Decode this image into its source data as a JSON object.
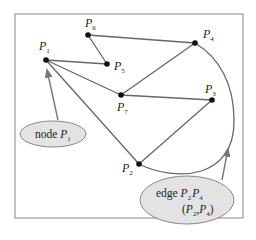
{
  "diagram": {
    "type": "graph",
    "nodes": [
      {
        "id": "P1",
        "label": "P",
        "sub": "1",
        "x": 46,
        "y": 60,
        "lx": 38,
        "ly": 50
      },
      {
        "id": "P2",
        "label": "P",
        "sub": "2",
        "x": 139,
        "y": 164,
        "lx": 122,
        "ly": 171
      },
      {
        "id": "P3",
        "label": "P",
        "sub": "3",
        "x": 212,
        "y": 100,
        "lx": 206,
        "ly": 92
      },
      {
        "id": "P4",
        "label": "P",
        "sub": "4",
        "x": 195,
        "y": 43,
        "lx": 203,
        "ly": 38
      },
      {
        "id": "P5",
        "label": "P",
        "sub": "5",
        "x": 107,
        "y": 64,
        "lx": 114,
        "ly": 70
      },
      {
        "id": "P6",
        "label": "P",
        "sub": "6",
        "x": 88,
        "y": 35,
        "lx": 85,
        "ly": 25
      },
      {
        "id": "P7",
        "label": "P",
        "sub": "7",
        "x": 121,
        "y": 95,
        "lx": 117,
        "ly": 111
      }
    ],
    "edges": [
      [
        "P1",
        "P5"
      ],
      [
        "P5",
        "P6"
      ],
      [
        "P6",
        "P4"
      ],
      [
        "P4",
        "P7"
      ],
      [
        "P7",
        "P3"
      ],
      [
        "P3",
        "P2"
      ],
      [
        "P1",
        "P7"
      ],
      [
        "P1",
        "P2"
      ],
      [
        "P2",
        "P4"
      ]
    ],
    "callouts": {
      "node": {
        "text": "node ",
        "sym": "P",
        "sub": "1"
      },
      "edge": {
        "line1_text": "edge ",
        "line1_sym1": "P",
        "line1_sub1": "2",
        "line1_sym2": "P",
        "line1_sub2": "4",
        "line2_open": "(",
        "line2_sym1": "P",
        "line2_sub1": "2",
        "line2_sep": ",",
        "line2_sym2": "P",
        "line2_sub2": "4",
        "line2_close": ")"
      }
    }
  }
}
